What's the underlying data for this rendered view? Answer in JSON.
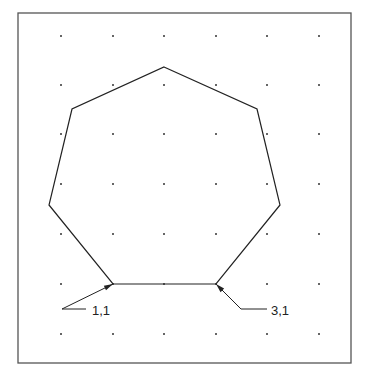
{
  "diagram": {
    "type": "polygon-on-grid",
    "shape": "heptagon",
    "frame": {
      "x": 18,
      "y": 13,
      "width": 333,
      "height": 350,
      "color": "#555555"
    },
    "grid": {
      "dot_color": "#333333",
      "xs": [
        61,
        113,
        164,
        216,
        267,
        319
      ],
      "ys": [
        36,
        85,
        134,
        184,
        234,
        284,
        334
      ]
    },
    "polygon": {
      "stroke": "#222222",
      "points": [
        [
          164,
          67
        ],
        [
          257,
          109
        ],
        [
          280,
          205
        ],
        [
          216,
          284
        ],
        [
          113,
          284
        ],
        [
          49,
          205
        ],
        [
          72,
          109
        ]
      ]
    },
    "labels": [
      {
        "text": "1,1",
        "x": 92,
        "y": 315,
        "arrow_to": [
          113,
          284
        ],
        "elbow": [
          62,
          309
        ],
        "tail": [
          86,
          309
        ]
      },
      {
        "text": "3,1",
        "x": 271,
        "y": 315,
        "arrow_to": [
          216,
          284
        ],
        "elbow": [
          241,
          309
        ],
        "tail": [
          267,
          309
        ]
      }
    ]
  }
}
